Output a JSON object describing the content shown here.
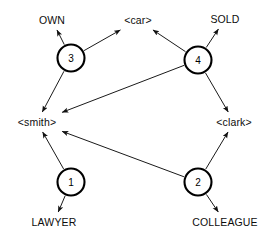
{
  "figure": {
    "width": 273,
    "height": 241,
    "background_color": "#ffffff",
    "stroke_color": "#1a1a1a",
    "text_color": "#0d0d0d"
  },
  "chart_data": {
    "type": "diagram",
    "subtype": "directed-graph",
    "title": "",
    "nodes": [
      {
        "id": "n3",
        "label": "3",
        "kind": "relation-node",
        "x": 71,
        "y": 58,
        "r": 13.5
      },
      {
        "id": "n4",
        "label": "4",
        "kind": "relation-node",
        "x": 198,
        "y": 60,
        "r": 13.5
      },
      {
        "id": "n1",
        "label": "1",
        "kind": "relation-node",
        "x": 71,
        "y": 182,
        "r": 13.5
      },
      {
        "id": "n2",
        "label": "2",
        "kind": "relation-node",
        "x": 198,
        "y": 182,
        "r": 13.5
      },
      {
        "id": "own",
        "label": "OWN",
        "kind": "concept-label",
        "x": 52,
        "y": 20
      },
      {
        "id": "car",
        "label": "<car>",
        "kind": "concept-label",
        "x": 138,
        "y": 20
      },
      {
        "id": "sold",
        "label": "SOLD",
        "kind": "concept-label",
        "x": 225,
        "y": 19
      },
      {
        "id": "smith",
        "label": "<smith>",
        "kind": "concept-label",
        "x": 37,
        "y": 122
      },
      {
        "id": "clark",
        "label": "<clark>",
        "kind": "concept-label",
        "x": 234,
        "y": 122
      },
      {
        "id": "lawyer",
        "label": "LAWYER",
        "kind": "concept-label",
        "x": 54,
        "y": 222
      },
      {
        "id": "colleague",
        "label": "COLLEAGUE",
        "kind": "concept-label",
        "x": 225,
        "y": 222
      }
    ],
    "edges": [
      {
        "id": "e1",
        "from": "n3",
        "to": "own",
        "directed": true
      },
      {
        "id": "e2",
        "from": "n3",
        "to": "car",
        "directed": true
      },
      {
        "id": "e3",
        "from": "n3",
        "to": "smith",
        "directed": true
      },
      {
        "id": "e4",
        "from": "n4",
        "to": "car",
        "directed": true
      },
      {
        "id": "e5",
        "from": "n4",
        "to": "sold",
        "directed": true
      },
      {
        "id": "e6",
        "from": "n4",
        "to": "smith",
        "directed": true
      },
      {
        "id": "e7",
        "from": "n4",
        "to": "clark",
        "directed": true
      },
      {
        "id": "e8",
        "from": "n1",
        "to": "smith",
        "directed": true
      },
      {
        "id": "e9",
        "from": "n1",
        "to": "lawyer",
        "directed": true
      },
      {
        "id": "e10",
        "from": "n2",
        "to": "smith",
        "directed": true
      },
      {
        "id": "e11",
        "from": "n2",
        "to": "clark",
        "directed": true
      },
      {
        "id": "e12",
        "from": "n2",
        "to": "colleague",
        "directed": true
      }
    ],
    "legend": [],
    "annotations": []
  },
  "caption": {
    "text": ""
  }
}
